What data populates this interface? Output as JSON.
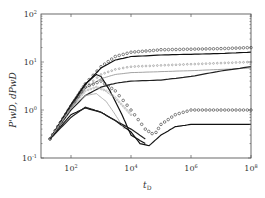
{
  "chart_data": {
    "type": "line",
    "title": "",
    "xlabel": "t_D",
    "ylabel": "P_wD', dP_wD",
    "xscale": "log",
    "yscale": "log",
    "xlim": [
      10,
      100000000
    ],
    "ylim": [
      0.1,
      100
    ],
    "x_ticks": [
      "10^2",
      "10^4",
      "10^6",
      "10^8"
    ],
    "y_ticks": [
      "10^-1",
      "10^0",
      "10^1",
      "10^2"
    ],
    "grid": false,
    "legend": null,
    "series": [
      {
        "name": "curve-1-markers-top",
        "style": "circle-markers",
        "color": "#333333",
        "x": [
          20,
          100,
          300,
          1000,
          3000,
          10000,
          100000,
          1000000,
          10000000,
          100000000
        ],
        "y": [
          0.25,
          1.2,
          3.5,
          8,
          13,
          16,
          18,
          18.5,
          19,
          20
        ]
      },
      {
        "name": "curve-2-line-top",
        "style": "solid",
        "color": "#111111",
        "x": [
          20,
          100,
          300,
          1000,
          3000,
          10000,
          100000,
          1000000,
          10000000,
          100000000
        ],
        "y": [
          0.25,
          1.2,
          3.4,
          7.5,
          11,
          13,
          14,
          14.5,
          15,
          16
        ]
      },
      {
        "name": "curve-3-markers-mid",
        "style": "dotted-markers",
        "color": "#888888",
        "x": [
          20,
          100,
          300,
          1000,
          3000,
          10000,
          100000,
          1000000,
          10000000,
          100000000
        ],
        "y": [
          0.25,
          1.1,
          3,
          5.5,
          7,
          8,
          8.5,
          9,
          9.5,
          10
        ]
      },
      {
        "name": "curve-4-line-mid",
        "style": "solid",
        "color": "#999999",
        "x": [
          20,
          100,
          300,
          1000,
          3000,
          10000,
          100000,
          1000000,
          10000000,
          100000000
        ],
        "y": [
          0.25,
          1.1,
          2.8,
          4.5,
          5.5,
          6,
          6.3,
          6.6,
          7,
          7.5
        ]
      },
      {
        "name": "curve-5-line-lower",
        "style": "solid",
        "color": "#222222",
        "x": [
          20,
          100,
          300,
          1000,
          3000,
          10000,
          100000,
          1000000,
          10000000,
          100000000
        ],
        "y": [
          0.25,
          1,
          2,
          3,
          3.6,
          4,
          4.2,
          5,
          6.5,
          8
        ]
      },
      {
        "name": "curve-6-hump-line",
        "style": "solid",
        "color": "#111111",
        "x": [
          20,
          100,
          300,
          700,
          1000,
          2000,
          5000,
          10000,
          30000
        ],
        "y": [
          0.25,
          1.3,
          3.5,
          5.5,
          5,
          2.5,
          0.8,
          0.3,
          0.2
        ]
      },
      {
        "name": "curve-7-hump-markers-dip",
        "style": "circle-markers",
        "color": "#333333",
        "x": [
          20,
          100,
          300,
          1000,
          3000,
          10000,
          30000,
          60000,
          100000,
          300000,
          1000000,
          10000000,
          100000000
        ],
        "y": [
          0.25,
          1.2,
          3,
          4,
          2.5,
          1,
          0.4,
          0.3,
          0.5,
          0.8,
          1,
          1,
          1
        ]
      },
      {
        "name": "curve-8-dip-line",
        "style": "solid",
        "color": "#111111",
        "x": [
          20,
          100,
          300,
          1000,
          3000,
          10000,
          20000,
          40000,
          100000,
          300000,
          1000000,
          10000000,
          100000000
        ],
        "y": [
          0.25,
          0.8,
          1.1,
          0.9,
          0.6,
          0.35,
          0.2,
          0.18,
          0.3,
          0.45,
          0.5,
          0.5,
          0.5
        ]
      },
      {
        "name": "curve-9-grey-hump",
        "style": "solid",
        "color": "#aaaaaa",
        "x": [
          20,
          100,
          300,
          700,
          1500,
          3000,
          6000
        ],
        "y": [
          0.25,
          1.1,
          2,
          2.2,
          1.5,
          0.8,
          0.4
        ]
      },
      {
        "name": "curve-10-grey-markers",
        "style": "dotted-markers",
        "color": "#999999",
        "x": [
          20,
          100,
          300,
          700,
          1500,
          3000,
          10000
        ],
        "y": [
          0.25,
          1.1,
          2.5,
          3,
          2.5,
          1.8,
          0.8
        ]
      },
      {
        "name": "curve-11-low-hump",
        "style": "solid",
        "color": "#222222",
        "x": [
          20,
          100,
          300,
          1000,
          3000,
          10000,
          30000
        ],
        "y": [
          0.25,
          0.7,
          1.15,
          0.9,
          0.6,
          0.4,
          0.25
        ]
      }
    ]
  },
  "axes": {
    "xlabel_main": "t",
    "xlabel_sub": "D",
    "ylabel_text": "P'wD, dPwD",
    "x_tick_labels": [
      {
        "base": "10",
        "exp": "2"
      },
      {
        "base": "10",
        "exp": "4"
      },
      {
        "base": "10",
        "exp": "6"
      },
      {
        "base": "10",
        "exp": "8"
      }
    ],
    "y_tick_labels": [
      {
        "base": "10",
        "exp": "-1"
      },
      {
        "base": "10",
        "exp": "0"
      },
      {
        "base": "10",
        "exp": "1"
      },
      {
        "base": "10",
        "exp": "2"
      }
    ]
  }
}
